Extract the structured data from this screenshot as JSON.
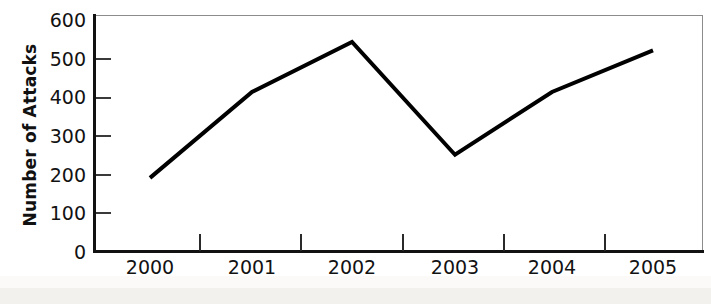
{
  "chart_data": {
    "type": "line",
    "title": "",
    "subtitle": "",
    "xlabel": "",
    "ylabel": "Number of Attacks",
    "categories": [
      "2000",
      "2001",
      "2002",
      "2003",
      "2004",
      "2005"
    ],
    "x": [
      2000,
      2001,
      2002,
      2003,
      2004,
      2005
    ],
    "values": [
      190,
      413,
      543,
      250,
      413,
      521
    ],
    "series": [
      {
        "name": "Number of Attacks",
        "values": [
          190,
          413,
          543,
          250,
          413,
          521
        ],
        "color": "#000000",
        "line_width": 4,
        "markers": false
      }
    ],
    "ylim": [
      0,
      600
    ],
    "yticks": [
      0,
      100,
      200,
      300,
      400,
      500,
      600
    ],
    "ytick_labels": [
      "0",
      "100",
      "200",
      "300",
      "400",
      "500",
      "600"
    ],
    "xtick_labels": [
      "2000",
      "2001",
      "2002",
      "2003",
      "2004",
      "2005"
    ],
    "grid": false,
    "legend": false,
    "legend_position": "none",
    "frame": true,
    "background_color": "#ffffff",
    "axis_color": "#121212",
    "frame_color": "#8c8c8c"
  },
  "axes": {
    "y_title": "Number of Attacks",
    "y_tick_labels": [
      "600",
      "500",
      "400",
      "300",
      "200",
      "100",
      "0"
    ],
    "x_tick_labels": [
      "2000",
      "2001",
      "2002",
      "2003",
      "2004",
      "2005"
    ]
  }
}
